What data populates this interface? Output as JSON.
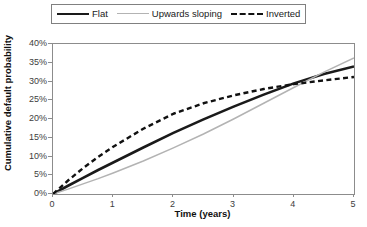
{
  "chart_data": {
    "type": "line",
    "title": "",
    "xlabel": "Time (years)",
    "ylabel": "Cumulative default probability",
    "xlim": [
      0,
      5
    ],
    "ylim": [
      0,
      0.4
    ],
    "grid": false,
    "legend_position": "top",
    "xticks": [
      "0",
      "1",
      "2",
      "3",
      "4",
      "5"
    ],
    "yticks": [
      "0%",
      "5%",
      "10%",
      "15%",
      "20%",
      "25%",
      "30%",
      "35%",
      "40%"
    ],
    "x": [
      0,
      0.25,
      0.5,
      0.75,
      1,
      1.5,
      2,
      2.5,
      3,
      3.5,
      4,
      4.5,
      5
    ],
    "series": [
      {
        "name": "Flat",
        "color": "#1a1a1a",
        "style": "solid",
        "width": 2.6,
        "values": [
          0,
          2.2,
          4.3,
          6.4,
          8.4,
          12.4,
          16.3,
          19.9,
          23.3,
          26.5,
          29.5,
          32.0,
          34.0
        ]
      },
      {
        "name": "Upwards sloping",
        "color": "#b3b3b3",
        "style": "solid",
        "width": 1.5,
        "values": [
          0,
          1.3,
          2.7,
          4.1,
          5.6,
          8.8,
          12.3,
          16.0,
          20.0,
          24.2,
          28.4,
          32.5,
          36.3
        ]
      },
      {
        "name": "Inverted",
        "color": "#111111",
        "style": "dashed",
        "width": 2.4,
        "values": [
          0,
          3.6,
          6.9,
          9.9,
          12.6,
          17.4,
          21.4,
          24.2,
          26.3,
          28.0,
          29.3,
          30.3,
          31.2
        ]
      }
    ]
  },
  "legend": {
    "items": [
      {
        "label": "Flat"
      },
      {
        "label": "Upwards sloping"
      },
      {
        "label": "Inverted"
      }
    ]
  },
  "axes": {
    "y_title": "Cumulative default probability",
    "x_title": "Time (years)",
    "y_tick_labels": [
      "40%",
      "35%",
      "30%",
      "25%",
      "20%",
      "15%",
      "10%",
      "5%",
      "0%"
    ],
    "x_tick_labels": [
      "0",
      "1",
      "2",
      "3",
      "4",
      "5"
    ]
  }
}
